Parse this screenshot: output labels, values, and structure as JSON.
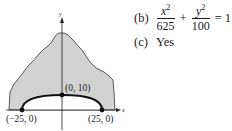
{
  "figure": {
    "y_axis_label": "y",
    "x_axis_label": "x",
    "points": [
      {
        "label": "(−25, 0)",
        "x": -25,
        "y": 0
      },
      {
        "label": "(0, 10)",
        "x": 0,
        "y": 10
      },
      {
        "label": "(25, 0)",
        "x": 25,
        "y": 0
      }
    ],
    "colors": {
      "shaded_region": "#d2d2d2",
      "outline": "#333333",
      "curve": "#111111"
    }
  },
  "answers": {
    "b": {
      "label": "(b)",
      "term1_num": "x",
      "term1_exp": "2",
      "term1_den": "625",
      "plus": "+",
      "term2_num": "y",
      "term2_exp": "2",
      "term2_den": "100",
      "equals": "= 1"
    },
    "c": {
      "label": "(c)",
      "text": "Yes"
    }
  }
}
